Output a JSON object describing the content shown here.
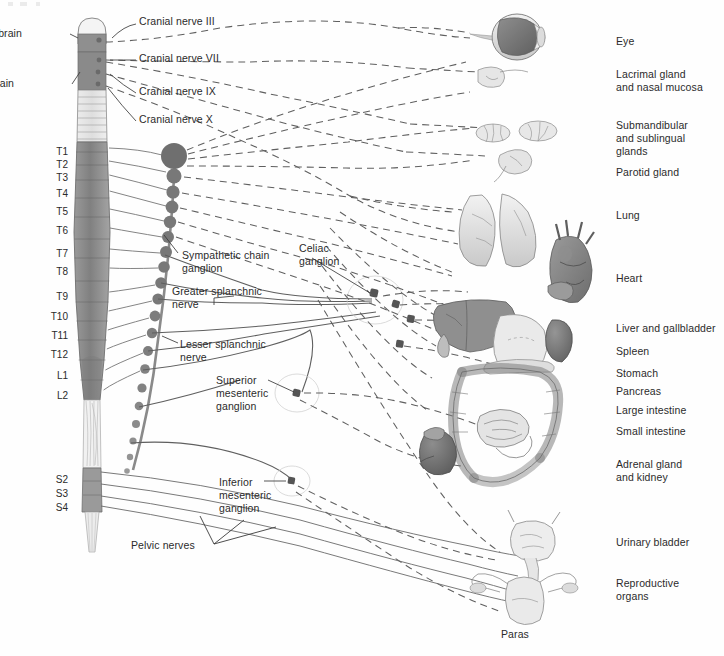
{
  "figure": {
    "domain": "anatomical-diagram"
  },
  "colors": {
    "ink": "#2b2b2b",
    "line": "#6e6e6e",
    "cord_gray_dark": "#8d8d8d",
    "cord_gray_mid": "#a6a6a6",
    "cord_gray_light": "#d8d8d8",
    "ganglion": "#7a7a7a",
    "organ_light": "#e2e2e2",
    "organ_mid": "#b9b9b9",
    "organ_dark": "#8a8a8a",
    "eye_dark": "#6f6f6f",
    "heart_dark": "#7e7e7e",
    "liver_dark": "#8c8c8c",
    "background": "#ffffff"
  },
  "brain_labels": [
    {
      "id": "midbrain",
      "text": "Midbrain",
      "x": 22,
      "y": 27
    },
    {
      "id": "hindbrain",
      "text": "Hindbrain",
      "x": 14,
      "y": 77
    }
  ],
  "cranial_nerves": [
    {
      "id": "cn3",
      "text": "Cranial nerve III",
      "x": 139,
      "y": 15
    },
    {
      "id": "cn7",
      "text": "Cranial nerve VII",
      "x": 139,
      "y": 52
    },
    {
      "id": "cn9",
      "text": "Cranial nerve IX",
      "x": 139,
      "y": 85
    },
    {
      "id": "cn10",
      "text": "Cranial nerve X",
      "x": 139,
      "y": 113
    }
  ],
  "spinal_segments": [
    {
      "id": "T1",
      "text": "T1",
      "y": 146
    },
    {
      "id": "T2",
      "text": "T2",
      "y": 159
    },
    {
      "id": "T3",
      "text": "T3",
      "y": 172
    },
    {
      "id": "T4",
      "text": "T4",
      "y": 188
    },
    {
      "id": "T5",
      "text": "T5",
      "y": 206
    },
    {
      "id": "T6",
      "text": "T6",
      "y": 225
    },
    {
      "id": "T7",
      "text": "T7",
      "y": 248
    },
    {
      "id": "T8",
      "text": "T8",
      "y": 266
    },
    {
      "id": "T9",
      "text": "T9",
      "y": 291
    },
    {
      "id": "T10",
      "text": "T10",
      "y": 311
    },
    {
      "id": "T11",
      "text": "T11",
      "y": 330
    },
    {
      "id": "T12",
      "text": "T12",
      "y": 349
    },
    {
      "id": "L1",
      "text": "L1",
      "y": 370
    },
    {
      "id": "L2",
      "text": "L2",
      "y": 390
    },
    {
      "id": "S2",
      "text": "S2",
      "y": 474
    },
    {
      "id": "S3",
      "text": "S3",
      "y": 488
    },
    {
      "id": "S4",
      "text": "S4",
      "y": 502
    }
  ],
  "structure_labels": [
    {
      "id": "sympathetic-chain-ganglion",
      "text": "Sympathetic chain\nganglion",
      "x": 182,
      "y": 249
    },
    {
      "id": "celiac-ganglion",
      "text": "Celiac\nganglion",
      "x": 299,
      "y": 242
    },
    {
      "id": "greater-splanchnic-nerve",
      "text": "Greater splanchnic\nnerve",
      "x": 172,
      "y": 285
    },
    {
      "id": "lesser-splanchnic-nerve",
      "text": "Lesser splanchnic\nnerve",
      "x": 180,
      "y": 338
    },
    {
      "id": "superior-mesenteric-ganglion",
      "text": "Superior\nmesenteric\nganglion",
      "x": 216,
      "y": 374
    },
    {
      "id": "inferior-mesenteric-ganglion",
      "text": "Inferior\nmesenteric\nganglion",
      "x": 219,
      "y": 476
    },
    {
      "id": "pelvic-nerves",
      "text": "Pelvic nerves",
      "x": 131,
      "y": 539
    },
    {
      "id": "parasympathetic-partial",
      "text": "Paras",
      "x": 501,
      "y": 628
    }
  ],
  "organ_labels": [
    {
      "id": "eye",
      "text": "Eye",
      "x": 616,
      "y": 35
    },
    {
      "id": "lacrimal-nasal",
      "text": "Lacrimal gland\nand nasal mucosa",
      "x": 616,
      "y": 68
    },
    {
      "id": "submandibular",
      "text": "Submandibular\nand sublingual\nglands",
      "x": 616,
      "y": 119
    },
    {
      "id": "parotid",
      "text": "Parotid gland",
      "x": 616,
      "y": 166
    },
    {
      "id": "lung",
      "text": "Lung",
      "x": 616,
      "y": 209
    },
    {
      "id": "heart",
      "text": "Heart",
      "x": 616,
      "y": 272
    },
    {
      "id": "liver-gallbladder",
      "text": "Liver and gallbladder",
      "x": 616,
      "y": 322
    },
    {
      "id": "spleen",
      "text": "Spleen",
      "x": 616,
      "y": 345
    },
    {
      "id": "stomach",
      "text": "Stomach",
      "x": 616,
      "y": 367
    },
    {
      "id": "pancreas",
      "text": "Pancreas",
      "x": 616,
      "y": 385
    },
    {
      "id": "large-intestine",
      "text": "Large intestine",
      "x": 616,
      "y": 404
    },
    {
      "id": "small-intestine",
      "text": "Small intestine",
      "x": 616,
      "y": 425
    },
    {
      "id": "adrenal-kidney",
      "text": "Adrenal gland\nand kidney",
      "x": 616,
      "y": 458
    },
    {
      "id": "urinary-bladder",
      "text": "Urinary bladder",
      "x": 616,
      "y": 536
    },
    {
      "id": "reproductive-organs",
      "text": "Reproductive\norgans",
      "x": 616,
      "y": 577
    }
  ],
  "legend_semantics": {
    "solid_line": "sympathetic (preganglionic/postganglionic) pathway",
    "dashed_line": "parasympathetic pathway"
  }
}
